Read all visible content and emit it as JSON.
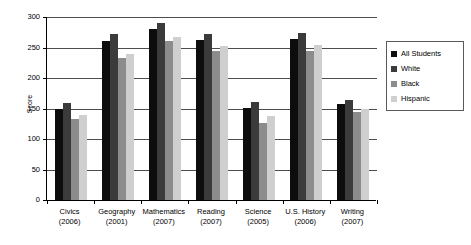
{
  "chart_data": {
    "type": "bar",
    "title": "",
    "xlabel": "",
    "ylabel": "Score",
    "ylim": [
      0,
      300
    ],
    "yticks": [
      0,
      50,
      100,
      150,
      200,
      250,
      300
    ],
    "grid": true,
    "legend_position": "right",
    "categories": [
      "Civics\n(2006)",
      "Geography\n(2001)",
      "Mathematics\n(2007)",
      "Reading\n(2007)",
      "Science\n(2005)",
      "U.S. History\n(2006)",
      "Writing\n(2007)"
    ],
    "category_names": [
      "Civics",
      "Geography",
      "Mathematics",
      "Reading",
      "Science",
      "U.S. History",
      "Writing"
    ],
    "category_years": [
      "(2006)",
      "(2001)",
      "(2007)",
      "(2007)",
      "(2005)",
      "(2006)",
      "(2007)"
    ],
    "series": [
      {
        "name": "All Students",
        "color": "#0d0d0d",
        "values": [
          150,
          261,
          281,
          263,
          151,
          264,
          157
        ]
      },
      {
        "name": "White",
        "color": "#3b3b3b",
        "values": [
          159,
          272,
          291,
          272,
          160,
          273,
          164
        ]
      },
      {
        "name": "Black",
        "color": "#8c8c8c",
        "values": [
          133,
          233,
          260,
          245,
          127,
          245,
          144
        ]
      },
      {
        "name": "Hispanic",
        "color": "#cfcfcf",
        "values": [
          140,
          240,
          268,
          252,
          137,
          254,
          149
        ]
      }
    ]
  },
  "axis": {
    "y_title": "Score",
    "y_tick_labels": [
      "300",
      "250",
      "200",
      "150",
      "100",
      "50",
      "0"
    ]
  },
  "legend": {
    "items": [
      {
        "label": "All Students",
        "color": "#0d0d0d"
      },
      {
        "label": "White",
        "color": "#3b3b3b"
      },
      {
        "label": "Black",
        "color": "#8c8c8c"
      },
      {
        "label": "Hispanic",
        "color": "#cfcfcf"
      }
    ]
  }
}
